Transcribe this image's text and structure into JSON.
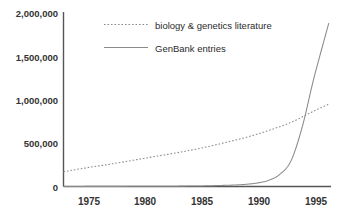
{
  "chart_data": {
    "type": "line",
    "title": "",
    "subtitle": "",
    "xlabel": "",
    "ylabel": "",
    "xlim": [
      1973,
      1996.5
    ],
    "ylim": [
      0,
      2000000
    ],
    "grid": false,
    "legend_position": "top-center",
    "x_ticks": [
      1975,
      1980,
      1985,
      1990,
      1995
    ],
    "x_tick_labels": [
      "1975",
      "1980",
      "1985",
      "1990",
      "1995"
    ],
    "y_ticks": [
      0,
      500000,
      1000000,
      1500000,
      2000000
    ],
    "y_tick_labels": [
      "0",
      "500,000",
      "1,000,000",
      "1,500,000",
      "2,000,000"
    ],
    "series": [
      {
        "name": "biology & genetics literature",
        "style": "dotted",
        "color": "#8a8a8a",
        "x": [
          1973,
          1975,
          1977,
          1979,
          1981,
          1983,
          1985,
          1987,
          1989,
          1991,
          1993,
          1995,
          1996.3
        ],
        "values": [
          170000,
          215000,
          255000,
          300000,
          345000,
          390000,
          440000,
          500000,
          565000,
          645000,
          740000,
          870000,
          950000
        ]
      },
      {
        "name": "GenBank entries",
        "style": "solid",
        "color": "#8a8a8a",
        "x": [
          1973,
          1977,
          1981,
          1984,
          1986,
          1988,
          1989,
          1990,
          1991,
          1992,
          1993,
          1994,
          1995,
          1996.3
        ],
        "values": [
          1000,
          1500,
          2500,
          5000,
          9000,
          17000,
          25000,
          40000,
          70000,
          140000,
          300000,
          700000,
          1250000,
          1880000
        ]
      }
    ]
  },
  "legend": {
    "items": [
      {
        "label": "biology & genetics literature",
        "style": "dotted"
      },
      {
        "label": "GenBank entries",
        "style": "solid"
      }
    ]
  },
  "axes": {
    "y_labels": [
      "2,000,000",
      "1,500,000",
      "1,000,000",
      "500,000",
      "0"
    ],
    "x_labels": [
      "1975",
      "1980",
      "1985",
      "1990",
      "1995"
    ]
  },
  "colors": {
    "axis": "#555555",
    "line": "#8a8a8a",
    "text": "#333333",
    "background": "#ffffff"
  }
}
